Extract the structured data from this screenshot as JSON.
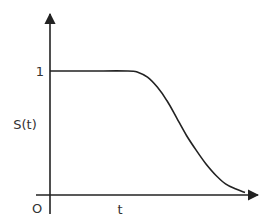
{
  "chart_data": {
    "type": "line",
    "title": "",
    "xlabel": "t",
    "ylabel": "S(t)",
    "origin_label": "O",
    "y_ticks": [
      {
        "value": 1,
        "label": "1"
      }
    ],
    "x_ticks": [],
    "xlim": [
      0,
      1.05
    ],
    "ylim": [
      0,
      1.3
    ],
    "grid": false,
    "legend": null,
    "series": [
      {
        "name": "S(t)",
        "x": [
          0.0,
          0.2,
          0.4,
          0.45,
          0.5,
          0.55,
          0.6,
          0.65,
          0.7,
          0.75,
          0.8,
          0.85,
          0.9,
          0.95,
          1.0
        ],
        "y": [
          1.0,
          1.0,
          1.0,
          0.99,
          0.95,
          0.87,
          0.76,
          0.62,
          0.48,
          0.36,
          0.25,
          0.16,
          0.09,
          0.05,
          0.02
        ]
      }
    ],
    "colors": {
      "axis": "#222222",
      "curve": "#222222",
      "text": "#333333"
    }
  }
}
